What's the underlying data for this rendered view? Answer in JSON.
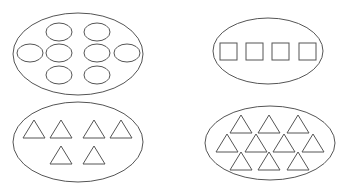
{
  "diagram": {
    "stroke_color": "#555555",
    "background": "#ffffff",
    "groups": [
      {
        "id": "group-ovals",
        "shape": "oval",
        "count": 8,
        "container": {
          "cx": 78,
          "cy": 54,
          "rx": 65,
          "ry": 41
        },
        "items": [
          {
            "cx": 59,
            "cy": 32
          },
          {
            "cx": 97,
            "cy": 32
          },
          {
            "cx": 30,
            "cy": 53
          },
          {
            "cx": 59,
            "cy": 53
          },
          {
            "cx": 97,
            "cy": 53
          },
          {
            "cx": 127,
            "cy": 53
          },
          {
            "cx": 59,
            "cy": 75
          },
          {
            "cx": 97,
            "cy": 75
          }
        ],
        "item_size": {
          "rx": 13,
          "ry": 9
        }
      },
      {
        "id": "group-squares",
        "shape": "square",
        "count": 4,
        "container": {
          "cx": 268,
          "cy": 51,
          "rx": 55,
          "ry": 33
        },
        "items": [
          {
            "x": 220,
            "y": 43
          },
          {
            "x": 246,
            "y": 43
          },
          {
            "x": 272,
            "y": 43
          },
          {
            "x": 299,
            "y": 43
          }
        ],
        "item_size": {
          "w": 17,
          "h": 17
        }
      },
      {
        "id": "group-triangles-6",
        "shape": "triangle",
        "count": 6,
        "container": {
          "cx": 78,
          "cy": 142,
          "rx": 65,
          "ry": 40
        },
        "items": [
          {
            "x": 23,
            "y": 120
          },
          {
            "x": 50,
            "y": 120
          },
          {
            "x": 83,
            "y": 120
          },
          {
            "x": 110,
            "y": 120
          },
          {
            "x": 50,
            "y": 146
          },
          {
            "x": 83,
            "y": 146
          }
        ],
        "item_size": {
          "w": 22,
          "h": 18
        }
      },
      {
        "id": "group-triangles-10",
        "shape": "triangle",
        "count": 10,
        "container": {
          "cx": 270,
          "cy": 143,
          "rx": 65,
          "ry": 37
        },
        "items": [
          {
            "x": 230,
            "y": 115
          },
          {
            "x": 258,
            "y": 115
          },
          {
            "x": 287,
            "y": 115
          },
          {
            "x": 216,
            "y": 134
          },
          {
            "x": 245,
            "y": 134
          },
          {
            "x": 273,
            "y": 134
          },
          {
            "x": 302,
            "y": 134
          },
          {
            "x": 230,
            "y": 152
          },
          {
            "x": 258,
            "y": 152
          },
          {
            "x": 287,
            "y": 152
          }
        ],
        "item_size": {
          "w": 22,
          "h": 18
        }
      }
    ]
  }
}
